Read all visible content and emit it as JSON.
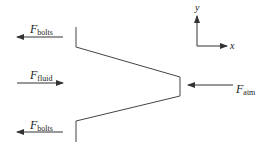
{
  "diagram": {
    "type": "free-body-diagram",
    "forces": [
      {
        "id": "bolts_top",
        "symbol": "F",
        "subscript": "bolts",
        "direction": "left"
      },
      {
        "id": "fluid",
        "symbol": "F",
        "subscript": "fluid",
        "direction": "right"
      },
      {
        "id": "bolts_bottom",
        "symbol": "F",
        "subscript": "bolts",
        "direction": "left"
      },
      {
        "id": "atm",
        "symbol": "F",
        "subscript": "atm",
        "direction": "left"
      }
    ],
    "axes": {
      "x_label": "x",
      "y_label": "y"
    },
    "colors": {
      "stroke": "#333333",
      "background": "#ffffff"
    }
  }
}
